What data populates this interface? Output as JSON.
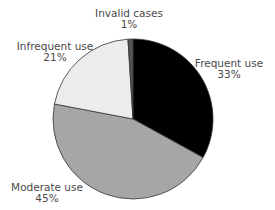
{
  "chart_data": {
    "type": "pie",
    "title": "",
    "center": [
      133,
      119
    ],
    "radius": 80,
    "start_angle_deg": 0,
    "direction": "clockwise",
    "slices": [
      {
        "label": "Frequent use",
        "value": 33,
        "pct_label": "33%",
        "color": "#000000"
      },
      {
        "label": "Moderate use",
        "value": 45,
        "pct_label": "45%",
        "color": "#a6a6a6"
      },
      {
        "label": "Infrequent use",
        "value": 21,
        "pct_label": "21%",
        "color": "#ececec"
      },
      {
        "label": "Invalid cases",
        "value": 1,
        "pct_label": "1%",
        "color": "#555555"
      }
    ],
    "legend": "none (direct labels)"
  },
  "labels": {
    "frequent": {
      "name": "Frequent use",
      "pct": "33%"
    },
    "moderate": {
      "name": "Moderate use",
      "pct": "45%"
    },
    "infrequent": {
      "name": "Infrequent use",
      "pct": "21%"
    },
    "invalid": {
      "name": "Invalid cases",
      "pct": "1%"
    }
  }
}
